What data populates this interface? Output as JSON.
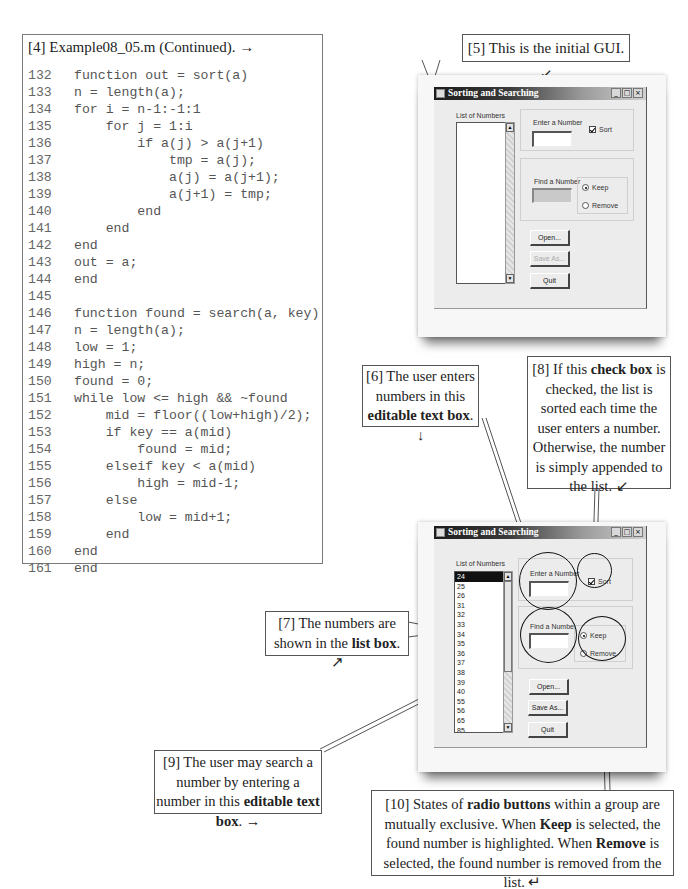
{
  "listing": {
    "title": "[4] Example08_05.m (Continued).",
    "title_arrow": "→",
    "lines": [
      {
        "n": "132",
        "code": "function out = sort(a)"
      },
      {
        "n": "133",
        "code": "n = length(a);"
      },
      {
        "n": "134",
        "code": "for i = n-1:-1:1"
      },
      {
        "n": "135",
        "code": "    for j = 1:i"
      },
      {
        "n": "136",
        "code": "        if a(j) > a(j+1)"
      },
      {
        "n": "137",
        "code": "            tmp = a(j);"
      },
      {
        "n": "138",
        "code": "            a(j) = a(j+1);"
      },
      {
        "n": "139",
        "code": "            a(j+1) = tmp;"
      },
      {
        "n": "140",
        "code": "        end"
      },
      {
        "n": "141",
        "code": "    end"
      },
      {
        "n": "142",
        "code": "end"
      },
      {
        "n": "143",
        "code": "out = a;"
      },
      {
        "n": "144",
        "code": "end"
      },
      {
        "n": "145",
        "code": ""
      },
      {
        "n": "146",
        "code": "function found = search(a, key)"
      },
      {
        "n": "147",
        "code": "n = length(a);"
      },
      {
        "n": "148",
        "code": "low = 1;"
      },
      {
        "n": "149",
        "code": "high = n;"
      },
      {
        "n": "150",
        "code": "found = 0;"
      },
      {
        "n": "151",
        "code": "while low <= high && ~found"
      },
      {
        "n": "152",
        "code": "    mid = floor((low+high)/2);"
      },
      {
        "n": "153",
        "code": "    if key == a(mid)"
      },
      {
        "n": "154",
        "code": "        found = mid;"
      },
      {
        "n": "155",
        "code": "    elseif key < a(mid)"
      },
      {
        "n": "156",
        "code": "        high = mid-1;"
      },
      {
        "n": "157",
        "code": "    else"
      },
      {
        "n": "158",
        "code": "        low = mid+1;"
      },
      {
        "n": "159",
        "code": "    end"
      },
      {
        "n": "160",
        "code": "end"
      },
      {
        "n": "161",
        "code": "end"
      }
    ]
  },
  "callouts": {
    "c5": "[5] This is the initial GUI. ↙",
    "c6": {
      "pre": "[6] The user enters numbers in this ",
      "bold": "editable text box",
      "post": ". ↓"
    },
    "c7": {
      "pre": "[7] The numbers are shown in the ",
      "bold": "list box",
      "post": ". ↗"
    },
    "c8": {
      "pre": "[8] If this ",
      "bold": "check box",
      "post": " is checked, the list is sorted each time the user enters a number. Otherwise, the number is simply appended to the list. ↙"
    },
    "c9": {
      "pre": "[9] The user may search a number by entering a number in this ",
      "bold": "editable text box",
      "post": ". →"
    },
    "c10": {
      "p1": "[10] States of ",
      "b1": "radio buttons",
      "p2": " within a group are mutually exclusive.  When ",
      "b2": "Keep",
      "p3": " is selected, the found number is highlighted.  When ",
      "b3": "Remove",
      "p4": " is selected, the found number is removed from the list. ↵"
    }
  },
  "gui": {
    "window_title": "Sorting and Searching",
    "list_label": "List of Numbers",
    "enter_label": "Enter a Number",
    "find_label": "Find a Number",
    "sort_label": "Sort",
    "keep_label": "Keep",
    "remove_label": "Remove",
    "open_label": "Open...",
    "save_label": "Save As...",
    "quit_label": "Quit",
    "minimize": "_",
    "maximize": "□",
    "close": "×",
    "scroll_up": "▲",
    "scroll_down": "▼"
  },
  "gui_initial": {
    "sort_checked": true,
    "selected_radio": "Keep",
    "save_enabled": false,
    "find_enabled": false,
    "list_items": []
  },
  "gui_populated": {
    "sort_checked": true,
    "selected_radio": "Keep",
    "save_enabled": true,
    "find_enabled": true,
    "selected_item": "24",
    "list_items": [
      "24",
      "25",
      "26",
      "31",
      "32",
      "33",
      "34",
      "35",
      "36",
      "37",
      "38",
      "39",
      "40",
      "55",
      "56",
      "65",
      "85",
      "101",
      "102",
      "103",
      "105"
    ]
  }
}
